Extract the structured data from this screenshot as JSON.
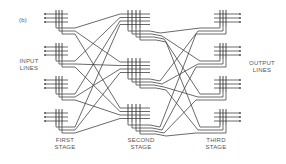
{
  "figure": {
    "panel_label": "(b)",
    "input_label_line1": "INPUT",
    "input_label_line2": "LINES",
    "output_label_line1": "OUTPUT",
    "output_label_line2": "LINES",
    "stages": [
      {
        "line1": "FIRST",
        "line2": "STAGE"
      },
      {
        "line1": "SECOND",
        "line2": "STAGE"
      },
      {
        "line1": "THIRD",
        "line2": "STAGE"
      }
    ],
    "first_stage_blocks": 4,
    "second_stage_blocks": 3,
    "third_stage_blocks": 4,
    "lines_per_block": 3,
    "line_color": "#444444"
  }
}
